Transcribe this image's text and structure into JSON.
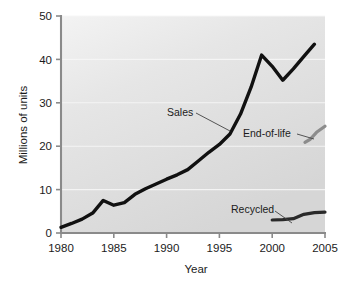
{
  "chart_data": {
    "type": "line",
    "title": "",
    "xlabel": "Year",
    "ylabel": "Millions of units",
    "xlim": [
      1980,
      2005
    ],
    "ylim": [
      0,
      50
    ],
    "xticks": [
      1980,
      1985,
      1990,
      1995,
      2000,
      2005
    ],
    "xtick_labels": [
      "1980",
      "1985",
      "1990",
      "1995",
      "2000",
      "2005"
    ],
    "yticks": [
      0,
      10,
      20,
      30,
      40,
      50
    ],
    "ytick_labels": [
      "0",
      "10",
      "20",
      "30",
      "40",
      "50"
    ],
    "grid": "horizontal-white-faint",
    "legend": "none-inline-annotations",
    "plot_background": "#e0e0e0",
    "series": [
      {
        "name": "Sales",
        "color": "#111111",
        "width": 3.4,
        "x": [
          1980,
          1981,
          1982,
          1983,
          1984,
          1985,
          1986,
          1987,
          1988,
          1989,
          1990,
          1991,
          1992,
          1993,
          1994,
          1995,
          1996,
          1997,
          1998,
          1999,
          2000,
          2001,
          2002,
          2003,
          2004
        ],
        "values": [
          1.3,
          2.2,
          3.2,
          4.6,
          7.5,
          6.4,
          7.0,
          8.9,
          10.2,
          11.3,
          12.4,
          13.4,
          14.6,
          16.6,
          18.6,
          20.4,
          22.8,
          27.4,
          33.6,
          41.0,
          38.4,
          35.2,
          37.8,
          40.7,
          43.5
        ]
      },
      {
        "name": "End-of-life",
        "color": "#8c8c8c",
        "width": 3.2,
        "x": [
          2003.1,
          2003.6,
          2004.2,
          2005
        ],
        "values": [
          20.9,
          21.6,
          23.2,
          24.6
        ]
      },
      {
        "name": "Recycled",
        "color": "#2a2a2a",
        "width": 3.2,
        "x": [
          2000,
          2001,
          2002,
          2003,
          2004,
          2005
        ],
        "values": [
          3.0,
          3.1,
          3.3,
          4.3,
          4.7,
          4.8
        ]
      }
    ],
    "annotations": [
      {
        "label": "Sales",
        "text_x": 167,
        "text_y": 116,
        "leader_from_x": 196,
        "leader_from_y": 113,
        "leader_to_x": 230,
        "leader_to_y": 131
      },
      {
        "label": "End-of-life",
        "text_x": 243,
        "text_y": 137,
        "leader_from_x": 297,
        "leader_from_y": 134,
        "leader_to_x": 314,
        "leader_to_y": 139
      },
      {
        "label": "Recycled",
        "text_x": 231,
        "text_y": 213,
        "leader_from_x": 275,
        "leader_from_y": 211,
        "leader_to_x": 292,
        "leader_to_y": 223
      }
    ]
  }
}
